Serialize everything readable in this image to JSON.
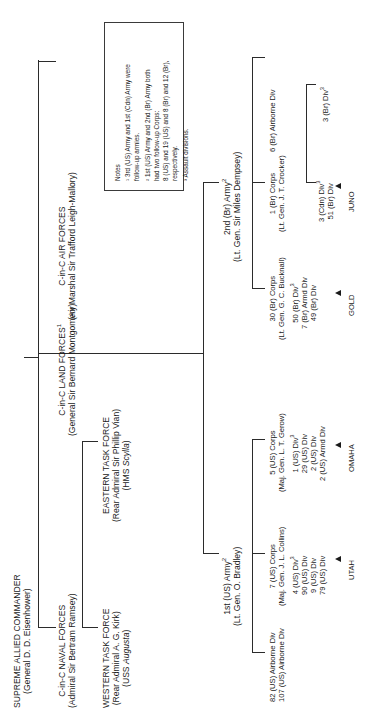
{
  "chart_title": "Allied Command Structure, Operation Overlord",
  "supreme": {
    "title": "SUPREME ALLIED COMMANDER",
    "holder": "(General D. D. Eisenhower)"
  },
  "top_commands": [
    {
      "name": "C-in-C NAVAL FORCES",
      "holder": "(Admiral Sir Bertram Ramsey)"
    },
    {
      "name": "C-in-C LAND FORCES",
      "note": "1",
      "holder": "(General Sir Bernard Montgomery)"
    },
    {
      "name": "C-in-C AIR FORCES",
      "holder": "(Air Marshal Sir Trafford Leigh-Mallory)"
    }
  ],
  "task_forces": [
    {
      "name": "WESTERN TASK FORCE",
      "holder": "(Rear Admiral A. G. Kirk)",
      "flagship": "(USS Augusta)",
      "flagship_italic": "Augusta",
      "flagship_prefix": "(USS ",
      "flagship_suffix": ")"
    },
    {
      "name": "EASTERN TASK FORCE",
      "holder": "(Rear Admiral Sir Phillip Vian)",
      "flagship": "(HMS Scylla)",
      "flagship_italic": "Scylla",
      "flagship_prefix": "(HMS ",
      "flagship_suffix": ")"
    }
  ],
  "armies": [
    {
      "name": "1st (US) Army",
      "note": "2",
      "holder": "(Lt. Gen. O. Bradley)",
      "airborne": [
        "82 (US) Airborne Div",
        "107 (US) Airborne Div"
      ],
      "corps": [
        {
          "name": "7 (US) Corps",
          "holder": "(Maj. Gen. J. L. Collins)",
          "divisions": [
            {
              "label": "4 (US) Div",
              "note": "3"
            },
            {
              "label": "90 (US) Div",
              "note": ""
            },
            {
              "label": "9 (US) Div",
              "note": ""
            },
            {
              "label": "79 (US) Div",
              "note": ""
            }
          ],
          "beach": "UTAH"
        },
        {
          "name": "5 (US) Corps",
          "holder": "(Maj. Gen. L. T. Gerow)",
          "divisions": [
            {
              "label": "1 (US) Div",
              "note": "3"
            },
            {
              "label": "29 (US) Div",
              "note": ""
            },
            {
              "label": "2 (US) Div",
              "note": ""
            },
            {
              "label": "2 (US) Armd Div",
              "note": ""
            }
          ],
          "beach": "OMAHA"
        }
      ]
    },
    {
      "name": "2nd (Br) Army",
      "note": "2",
      "holder": "(Lt. Gen. Sir Miles Dempsey)",
      "airborne": [
        "6 (Br) Airborne Div"
      ],
      "corps": [
        {
          "name": "30 (Br) Corps",
          "holder": "(Lt. Gen. G. C. Bucknall)",
          "divisions": [
            {
              "label": "50 (Br) Div",
              "note": "3"
            },
            {
              "label": "7 (Br) Armd Div",
              "note": ""
            },
            {
              "label": "49 (Br) Div",
              "note": ""
            }
          ],
          "beach": "GOLD"
        },
        {
          "name": "1 (Br) Corps",
          "holder": "(Lt. Gen. J. T. Crocker)",
          "divisions": [
            {
              "label": "3 (Cdn) Div",
              "note": "3"
            },
            {
              "label": "51 (Br) Div",
              "note": ""
            }
          ],
          "beach": "JUNO",
          "sub_divisions": [
            {
              "label": "3 (Br) Div",
              "note": "3"
            }
          ]
        }
      ]
    }
  ],
  "notes": {
    "heading": "Notes",
    "items": [
      {
        "marker": "1",
        "text": "3rd (US) Army and 1st (Cdn) Army were follow-up armies."
      },
      {
        "marker": "2",
        "text": "1st (US) Army and 2nd (Br) Army both had two follow-up Corps: 8 (US) and 19 (US) and 8 (Br) and 12 (Br), respectively."
      },
      {
        "marker": "3",
        "text": "Assault divisions."
      }
    ],
    "lines": [
      "Notes",
      "¹ 3rd (US) Army and 1st (Cdn) Army were",
      "follow-up armies.",
      "² 1st (US) Army and 2nd (Br) Army both",
      "had two follow-up Corps:",
      "8 (US) and 19 (US) and 8 (Br) and 12 (Br),",
      "respectively.",
      "³ Assault divisions."
    ]
  },
  "colors": {
    "line": "#2b2b2b",
    "text": "#1a1a1a",
    "background": "#ffffff"
  }
}
